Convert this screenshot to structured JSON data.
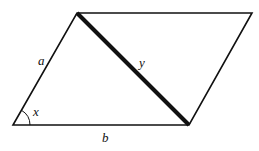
{
  "diagram": {
    "type": "parallelogram",
    "vertices": {
      "bottom_left": [
        13,
        125
      ],
      "top_left": [
        77,
        13
      ],
      "top_right": [
        252,
        13
      ],
      "bottom_right": [
        189,
        125
      ]
    },
    "labels": {
      "side_a": "a",
      "side_b": "b",
      "diagonal_y": "y",
      "angle_x": "x"
    },
    "colors": {
      "stroke": "#111111",
      "background": "#ffffff"
    }
  }
}
